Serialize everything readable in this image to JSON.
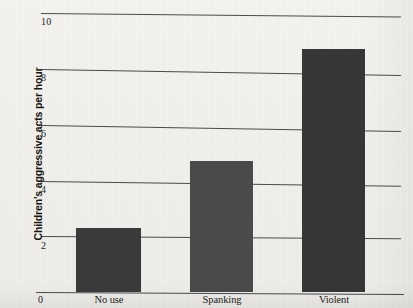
{
  "chart_data": {
    "type": "bar",
    "title": "",
    "subtitle": "",
    "xlabel": "",
    "ylabel": "Children's aggressive acts per hour",
    "categories": [
      "No use",
      "Spanking",
      "Violent"
    ],
    "values": [
      2.3,
      4.7,
      8.7
    ],
    "series": [
      {
        "name": "Children's aggressive acts per hour",
        "values": [
          2.3,
          4.7,
          8.7
        ]
      }
    ],
    "ylim": [
      0,
      10
    ],
    "yticks": [
      0,
      2,
      4,
      6,
      8,
      10
    ],
    "ytick_labels": [
      "0",
      "2",
      "4",
      "6",
      "8",
      "10"
    ],
    "grid": "horizontal",
    "legend": "none",
    "bar_colors": [
      "#3a3a3a",
      "#4a4a4a",
      "#363636"
    ],
    "annotations": []
  },
  "figure": {
    "background_color": "#f2f1ee",
    "gridline_color": "#4a4a4a",
    "axis_text_color": "#1d1d18"
  }
}
